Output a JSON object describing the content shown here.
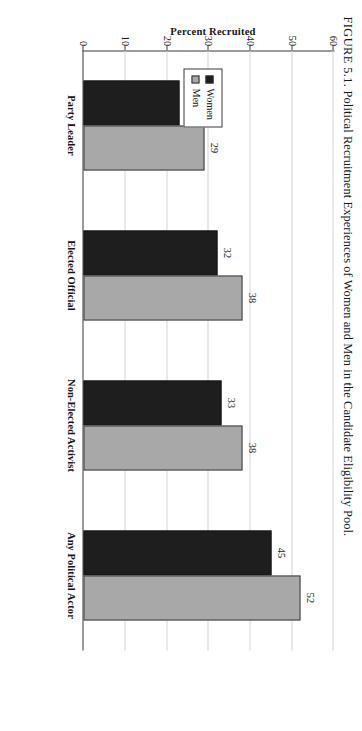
{
  "figure": {
    "label": "FIGURE 5.1.",
    "caption": "Political Recruitment Experiences of Women and Men in the Candidate Eligibility Pool.",
    "full_caption": "FIGURE 5.1. Political Recruitment Experiences of Women and Men in the Candidate Eligibility Pool.",
    "page_orientation": "rotated-90-clockwise"
  },
  "legend": {
    "position": "inside-plot-left",
    "entries": [
      {
        "label": "Women",
        "color": "#1e1e1e"
      },
      {
        "label": "Men",
        "color": "#a8a8a8"
      }
    ]
  },
  "colors": {
    "women": "#1e1e1e",
    "men": "#a8a8a8",
    "axis": "#3a3a3c",
    "grid": "#d3d3d6",
    "text": "#17171a",
    "page": "#ffffff"
  },
  "chart_data": {
    "type": "bar",
    "title": "Political Recruitment Experiences of Women and Men in the Candidate Eligibility Pool",
    "categories": [
      "Party Leader",
      "Elected Official",
      "Non-Elected Activist",
      "Any Political Actor"
    ],
    "series": [
      {
        "name": "Women",
        "values": [
          23,
          32,
          33,
          45
        ]
      },
      {
        "name": "Men",
        "values": [
          29,
          38,
          38,
          52
        ]
      }
    ],
    "xlabel": "",
    "ylabel": "Percent Recruited",
    "ylim": [
      0,
      60
    ],
    "yticks": [
      0,
      10,
      20,
      30,
      40,
      50,
      60
    ],
    "ytick_labels": [
      "0",
      "10",
      "20",
      "30",
      "40",
      "50",
      "60"
    ],
    "grid": true,
    "grid_axis": "y",
    "legend_position": "upper left",
    "data_labels": true
  }
}
